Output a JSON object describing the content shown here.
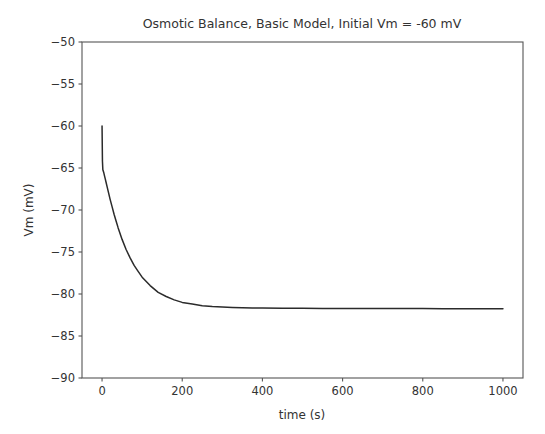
{
  "chart_data": {
    "type": "line",
    "title": "Osmotic Balance, Basic Model, Initial Vm = -60 mV",
    "xlabel": "time (s)",
    "ylabel": "Vm (mV)",
    "xlim": [
      -50,
      1050
    ],
    "ylim": [
      -90,
      -50
    ],
    "xticks": [
      0,
      200,
      400,
      600,
      800,
      1000
    ],
    "xtick_labels": [
      "0",
      "200",
      "400",
      "600",
      "800",
      "1000"
    ],
    "yticks": [
      -90,
      -85,
      -80,
      -75,
      -70,
      -65,
      -60,
      -55,
      -50
    ],
    "ytick_labels": [
      "−90",
      "−85",
      "−80",
      "−75",
      "−70",
      "−65",
      "−60",
      "−55",
      "−50"
    ],
    "grid": false,
    "legend": null,
    "line_color": "#2b2b2b",
    "series": [
      {
        "name": "Vm",
        "x": [
          0,
          1,
          2,
          4,
          6,
          8,
          10,
          13,
          16,
          20,
          25,
          30,
          35,
          40,
          50,
          60,
          70,
          80,
          90,
          100,
          120,
          140,
          160,
          180,
          200,
          225,
          250,
          275,
          300,
          325,
          350,
          375,
          400,
          450,
          500,
          550,
          600,
          650,
          700,
          750,
          800,
          850,
          900,
          950,
          1000
        ],
        "y": [
          -60.0,
          -64.2,
          -65.2,
          -65.5,
          -65.9,
          -66.3,
          -66.7,
          -67.3,
          -67.9,
          -68.7,
          -69.6,
          -70.5,
          -71.3,
          -72.1,
          -73.5,
          -74.7,
          -75.7,
          -76.6,
          -77.3,
          -78.0,
          -79.0,
          -79.8,
          -80.3,
          -80.7,
          -81.0,
          -81.2,
          -81.4,
          -81.5,
          -81.55,
          -81.6,
          -81.63,
          -81.66,
          -81.68,
          -81.7,
          -81.71,
          -81.72,
          -81.73,
          -81.73,
          -81.74,
          -81.74,
          -81.74,
          -81.75,
          -81.75,
          -81.75,
          -81.75
        ]
      }
    ],
    "annotations": [
      "Initial step: Vm drops sharply from -60 mV to about -65 mV at t = 0",
      "Exponential relaxation to steady state near -81.7 mV"
    ]
  },
  "figure": {
    "background_color": "#ffffff",
    "axes_color": "#555555",
    "text_color": "#333333"
  }
}
